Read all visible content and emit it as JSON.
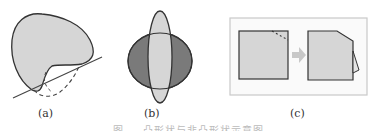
{
  "figure": {
    "panels": [
      {
        "id": "a",
        "label": "(a)",
        "description": "Non-convex blob with a tangent line and dashed convex-hull completion"
      },
      {
        "id": "b",
        "label": "(b)",
        "description": "Dark horizontal ellipse overlapped by light vertical ellipse"
      },
      {
        "id": "c",
        "label": "(c)",
        "description": "Square with dashed corner cut, arrow, square with corner folded out"
      }
    ],
    "caption": "图 … 凸形状与非凸形状示意图"
  },
  "colors": {
    "fill_light": "#d6d6d6",
    "fill_dark": "#7a7a7a",
    "stroke": "#333333",
    "arrow": "#c8c8c8",
    "frame": "#c9c9c9"
  }
}
